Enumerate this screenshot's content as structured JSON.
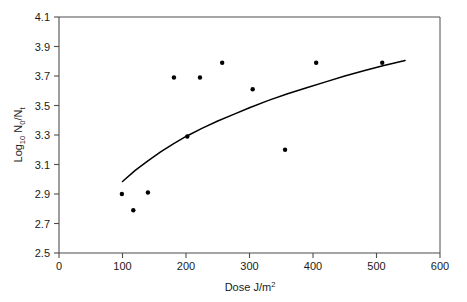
{
  "chart_data": {
    "type": "scatter",
    "title": "",
    "xlabel": "Dose J/m2",
    "xlabel_parts": {
      "lead": "Dose J/m",
      "sup": "2"
    },
    "ylabel": "Log10 N0/Nt",
    "ylabel_parts": {
      "lead": "Log",
      "sub1": "10",
      "mid": " N",
      "sub2": "0",
      "slash": "/N",
      "sub3": "t"
    },
    "xlim": [
      0,
      600
    ],
    "ylim": [
      2.5,
      4.1
    ],
    "xticks": [
      0,
      100,
      200,
      300,
      400,
      500,
      600
    ],
    "xtick_labels": [
      "0",
      "100",
      "200",
      "300",
      "400",
      "500",
      "600"
    ],
    "yticks": [
      2.5,
      2.7,
      2.9,
      3.1,
      3.3,
      3.5,
      3.7,
      3.9,
      4.1
    ],
    "ytick_labels": [
      "2.5",
      "2.7",
      "2.9",
      "3.1",
      "3.3",
      "3.5",
      "3.7",
      "3.9",
      "4.1"
    ],
    "grid": false,
    "legend": "none",
    "marker_color": "#000000",
    "line_color": "#000000",
    "axis_color": "#4d4d4d",
    "series": [
      {
        "name": "observed",
        "type": "scatter",
        "marker": "filled-circle",
        "points": [
          {
            "x": 99,
            "y": 2.9
          },
          {
            "x": 117,
            "y": 2.79
          },
          {
            "x": 140,
            "y": 2.91
          },
          {
            "x": 181,
            "y": 3.69
          },
          {
            "x": 202,
            "y": 3.29
          },
          {
            "x": 222,
            "y": 3.69
          },
          {
            "x": 257,
            "y": 3.79
          },
          {
            "x": 305,
            "y": 3.61
          },
          {
            "x": 356,
            "y": 3.2
          },
          {
            "x": 405,
            "y": 3.79
          },
          {
            "x": 509,
            "y": 3.79
          }
        ]
      },
      {
        "name": "fitted-curve",
        "type": "line",
        "points": [
          {
            "x": 100,
            "y": 2.985
          },
          {
            "x": 120,
            "y": 3.06
          },
          {
            "x": 140,
            "y": 3.125
          },
          {
            "x": 160,
            "y": 3.185
          },
          {
            "x": 180,
            "y": 3.24
          },
          {
            "x": 200,
            "y": 3.29
          },
          {
            "x": 225,
            "y": 3.345
          },
          {
            "x": 250,
            "y": 3.395
          },
          {
            "x": 275,
            "y": 3.44
          },
          {
            "x": 300,
            "y": 3.485
          },
          {
            "x": 330,
            "y": 3.535
          },
          {
            "x": 360,
            "y": 3.58
          },
          {
            "x": 390,
            "y": 3.62
          },
          {
            "x": 420,
            "y": 3.66
          },
          {
            "x": 450,
            "y": 3.7
          },
          {
            "x": 480,
            "y": 3.735
          },
          {
            "x": 510,
            "y": 3.77
          },
          {
            "x": 530,
            "y": 3.79
          },
          {
            "x": 545,
            "y": 3.805
          }
        ]
      }
    ]
  }
}
